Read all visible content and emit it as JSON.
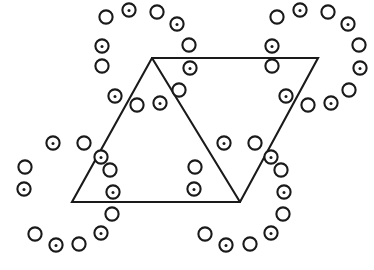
{
  "figure": {
    "background_color": "#ffffff",
    "stroke_color": "#1a1a1a",
    "stroke_width": 2.1,
    "canvas": {
      "width": 374,
      "height": 270
    }
  },
  "legend": {
    "plain_node_label": "open circle",
    "dotted_node_label": "circle with center dot"
  },
  "shapes": {
    "parallelogram": {
      "name": "parallelogram-outline",
      "points": "152,58 318,58 240,202 72,202",
      "closed": true
    },
    "diagonal": {
      "name": "diagonal-divider",
      "points": "152,58 240,202"
    }
  },
  "node_radius": 6.6,
  "dot_radius": 1.5,
  "rings": [
    {
      "name": "ring-top-left",
      "center_x": 124,
      "center_y": 72,
      "radius_x": 66,
      "radius_y": 63,
      "count": 12,
      "start_angle": -122,
      "dotted_first": false
    },
    {
      "name": "ring-top-right",
      "center_x": 294,
      "center_y": 72,
      "radius_x": 66,
      "radius_y": 63,
      "count": 12,
      "start_angle": -122,
      "dotted_first": false
    },
    {
      "name": "ring-bottom-left",
      "center_x": 69,
      "center_y": 198,
      "radius_x": 66,
      "radius_y": 63,
      "count": 12,
      "start_angle": -122,
      "dotted_first": false
    },
    {
      "name": "ring-bottom-right",
      "center_x": 240,
      "center_y": 198,
      "radius_x": 66,
      "radius_y": 63,
      "count": 12,
      "start_angle": -122,
      "dotted_first": false
    }
  ],
  "nodes": [
    {
      "x": 106,
      "y": 17,
      "dotted": false
    },
    {
      "x": 129,
      "y": 10,
      "dotted": true
    },
    {
      "x": 157,
      "y": 12,
      "dotted": false
    },
    {
      "x": 177,
      "y": 24,
      "dotted": true
    },
    {
      "x": 189,
      "y": 45,
      "dotted": false
    },
    {
      "x": 190,
      "y": 68,
      "dotted": true
    },
    {
      "x": 179,
      "y": 90,
      "dotted": false
    },
    {
      "x": 160,
      "y": 103,
      "dotted": true
    },
    {
      "x": 137,
      "y": 105,
      "dotted": false
    },
    {
      "x": 115,
      "y": 96,
      "dotted": true
    },
    {
      "x": 102,
      "y": 66,
      "dotted": false
    },
    {
      "x": 102,
      "y": 46,
      "dotted": true
    },
    {
      "x": 277,
      "y": 17,
      "dotted": false
    },
    {
      "x": 300,
      "y": 10,
      "dotted": true
    },
    {
      "x": 328,
      "y": 12,
      "dotted": false
    },
    {
      "x": 348,
      "y": 24,
      "dotted": true
    },
    {
      "x": 359,
      "y": 45,
      "dotted": false
    },
    {
      "x": 360,
      "y": 68,
      "dotted": true
    },
    {
      "x": 349,
      "y": 90,
      "dotted": false
    },
    {
      "x": 331,
      "y": 103,
      "dotted": true
    },
    {
      "x": 308,
      "y": 105,
      "dotted": false
    },
    {
      "x": 286,
      "y": 96,
      "dotted": true
    },
    {
      "x": 272,
      "y": 66,
      "dotted": false
    },
    {
      "x": 272,
      "y": 46,
      "dotted": true
    },
    {
      "x": 53,
      "y": 143,
      "dotted": true
    },
    {
      "x": 84,
      "y": 143,
      "dotted": false
    },
    {
      "x": 101,
      "y": 157,
      "dotted": true
    },
    {
      "x": 110,
      "y": 170,
      "dotted": false
    },
    {
      "x": 113,
      "y": 192,
      "dotted": true
    },
    {
      "x": 112,
      "y": 214,
      "dotted": false
    },
    {
      "x": 101,
      "y": 233,
      "dotted": true
    },
    {
      "x": 79,
      "y": 244,
      "dotted": false
    },
    {
      "x": 56,
      "y": 245,
      "dotted": true
    },
    {
      "x": 35,
      "y": 234,
      "dotted": false
    },
    {
      "x": 24,
      "y": 189,
      "dotted": true
    },
    {
      "x": 25,
      "y": 167,
      "dotted": false
    },
    {
      "x": 224,
      "y": 143,
      "dotted": true
    },
    {
      "x": 255,
      "y": 143,
      "dotted": false
    },
    {
      "x": 271,
      "y": 157,
      "dotted": true
    },
    {
      "x": 281,
      "y": 170,
      "dotted": false
    },
    {
      "x": 284,
      "y": 192,
      "dotted": true
    },
    {
      "x": 283,
      "y": 214,
      "dotted": false
    },
    {
      "x": 271,
      "y": 233,
      "dotted": true
    },
    {
      "x": 250,
      "y": 244,
      "dotted": false
    },
    {
      "x": 226,
      "y": 245,
      "dotted": true
    },
    {
      "x": 205,
      "y": 234,
      "dotted": false
    },
    {
      "x": 194,
      "y": 189,
      "dotted": true
    },
    {
      "x": 195,
      "y": 167,
      "dotted": false
    }
  ]
}
